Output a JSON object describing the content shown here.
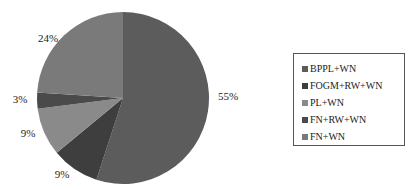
{
  "chart_data": {
    "type": "pie",
    "title": "",
    "categories": [
      "BPPL+WN",
      "FOGM+RW+WN",
      "PL+WN",
      "FN+RW+WN",
      "FN+WN"
    ],
    "values": [
      55,
      9,
      9,
      3,
      24
    ],
    "labels": [
      "55%",
      "9%",
      "9%",
      "3%",
      "24%"
    ],
    "colors": [
      "#5c5c5c",
      "#3e3e3e",
      "#8a8a8a",
      "#4a4a4a",
      "#7a7a7a"
    ],
    "legend_position": "right"
  },
  "legend": {
    "items": [
      {
        "label": "BPPL+WN",
        "color": "#5c5c5c"
      },
      {
        "label": "FOGM+RW+WN",
        "color": "#3e3e3e"
      },
      {
        "label": "PL+WN",
        "color": "#8a8a8a"
      },
      {
        "label": "FN+RW+WN",
        "color": "#4a4a4a"
      },
      {
        "label": "FN+WN",
        "color": "#7a7a7a"
      }
    ]
  }
}
